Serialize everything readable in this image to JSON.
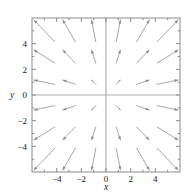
{
  "figure": {
    "name": "vector-field-plot",
    "background": "#ffffff",
    "frame_color": "#8c8c8c",
    "axis_color": "#b0b0b0",
    "arrow_color": "#8a8a8a"
  },
  "axes": {
    "x_title": "x",
    "y_title": "y",
    "x_ticklabels": [
      "-4",
      "-2",
      "0",
      "2",
      "4"
    ],
    "y_ticklabels": [
      "4",
      "2",
      "0",
      "-2",
      "-4"
    ],
    "x_tickvalues": [
      -4,
      -2,
      0,
      2,
      4
    ],
    "y_tickvalues": [
      4,
      2,
      0,
      -2,
      -4
    ],
    "x_minor_tickvalues": [
      -5,
      -3,
      -1,
      1,
      3,
      5
    ],
    "y_minor_tickvalues": [
      -5,
      -3,
      -1,
      1,
      3,
      5
    ]
  },
  "chart_data": {
    "type": "scatter",
    "title": "",
    "xlabel": "x",
    "ylabel": "y",
    "xlim": [
      -6,
      6
    ],
    "ylim": [
      -6,
      6
    ],
    "grid": false,
    "legend": null,
    "plot_kind": "vector-field",
    "field_definition": "F(x,y) = <x, y>",
    "grid_x": [
      -5,
      -3,
      -1,
      1,
      3,
      5
    ],
    "grid_y": [
      -5,
      -3,
      -1,
      1,
      3,
      5
    ],
    "arrow_scale": 0.17,
    "vectors": [
      {
        "x": -5,
        "y": 5,
        "u": -5,
        "v": 5
      },
      {
        "x": -3,
        "y": 5,
        "u": -3,
        "v": 5
      },
      {
        "x": -1,
        "y": 5,
        "u": -1,
        "v": 5
      },
      {
        "x": 1,
        "y": 5,
        "u": 1,
        "v": 5
      },
      {
        "x": 3,
        "y": 5,
        "u": 3,
        "v": 5
      },
      {
        "x": 5,
        "y": 5,
        "u": 5,
        "v": 5
      },
      {
        "x": -5,
        "y": 3,
        "u": -5,
        "v": 3
      },
      {
        "x": -3,
        "y": 3,
        "u": -3,
        "v": 3
      },
      {
        "x": -1,
        "y": 3,
        "u": -1,
        "v": 3
      },
      {
        "x": 1,
        "y": 3,
        "u": 1,
        "v": 3
      },
      {
        "x": 3,
        "y": 3,
        "u": 3,
        "v": 3
      },
      {
        "x": 5,
        "y": 3,
        "u": 5,
        "v": 3
      },
      {
        "x": -5,
        "y": 1,
        "u": -5,
        "v": 1
      },
      {
        "x": -3,
        "y": 1,
        "u": -3,
        "v": 1
      },
      {
        "x": -1,
        "y": 1,
        "u": -1,
        "v": 1
      },
      {
        "x": 1,
        "y": 1,
        "u": 1,
        "v": 1
      },
      {
        "x": 3,
        "y": 1,
        "u": 3,
        "v": 1
      },
      {
        "x": 5,
        "y": 1,
        "u": 5,
        "v": 1
      },
      {
        "x": -5,
        "y": -1,
        "u": -5,
        "v": -1
      },
      {
        "x": -3,
        "y": -1,
        "u": -3,
        "v": -1
      },
      {
        "x": -1,
        "y": -1,
        "u": -1,
        "v": -1
      },
      {
        "x": 1,
        "y": -1,
        "u": 1,
        "v": -1
      },
      {
        "x": 3,
        "y": -1,
        "u": 3,
        "v": -1
      },
      {
        "x": 5,
        "y": -1,
        "u": 5,
        "v": -1
      },
      {
        "x": -5,
        "y": -3,
        "u": -5,
        "v": -3
      },
      {
        "x": -3,
        "y": -3,
        "u": -3,
        "v": -3
      },
      {
        "x": -1,
        "y": -3,
        "u": -1,
        "v": -3
      },
      {
        "x": 1,
        "y": -3,
        "u": 1,
        "v": -3
      },
      {
        "x": 3,
        "y": -3,
        "u": 3,
        "v": -3
      },
      {
        "x": 5,
        "y": -3,
        "u": 5,
        "v": -3
      },
      {
        "x": -5,
        "y": -5,
        "u": -5,
        "v": -5
      },
      {
        "x": -3,
        "y": -5,
        "u": -3,
        "v": -5
      },
      {
        "x": -1,
        "y": -5,
        "u": -1,
        "v": -5
      },
      {
        "x": 1,
        "y": -5,
        "u": 1,
        "v": -5
      },
      {
        "x": 3,
        "y": -5,
        "u": 3,
        "v": -5
      },
      {
        "x": 5,
        "y": -5,
        "u": 5,
        "v": -5
      }
    ]
  }
}
